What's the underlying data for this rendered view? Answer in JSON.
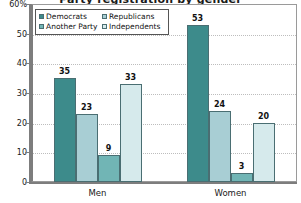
{
  "chart_data": {
    "type": "bar",
    "title": "Party registration by gender",
    "xlabel": "",
    "ylabel": "",
    "ylim": [
      0,
      60
    ],
    "ytick_labels": [
      "60%",
      "50",
      "40",
      "30",
      "20",
      "10",
      "0"
    ],
    "ytick_values": [
      60,
      50,
      40,
      30,
      20,
      10,
      0
    ],
    "grid": true,
    "legend_position": "top-left",
    "categories": [
      "Men",
      "Women"
    ],
    "series": [
      {
        "name": "Democrats",
        "values": [
          35,
          23
        ],
        "color": "#3d8b8b"
      },
      {
        "name": "Republicans",
        "values": [
          23,
          24
        ],
        "color": "#a8ced4"
      },
      {
        "name": "Another Party",
        "values": [
          9,
          3
        ],
        "color": "#71b5b5"
      },
      {
        "name": "Independents",
        "values": [
          33,
          20
        ],
        "color": "#d6eaec"
      }
    ],
    "data_labels": {
      "Men": [
        35,
        23,
        9,
        33
      ],
      "Women": [
        53,
        24,
        3,
        20
      ]
    },
    "bars": [
      {
        "group": "Men",
        "series": "Democrats",
        "value": 35,
        "color": "#3d8b8b"
      },
      {
        "group": "Men",
        "series": "Republicans",
        "value": 23,
        "color": "#a8ced4"
      },
      {
        "group": "Men",
        "series": "Another Party",
        "value": 9,
        "color": "#71b5b5"
      },
      {
        "group": "Men",
        "series": "Independents",
        "value": 33,
        "color": "#d6eaec"
      },
      {
        "group": "Women",
        "series": "Democrats",
        "value": 53,
        "color": "#3d8b8b"
      },
      {
        "group": "Women",
        "series": "Republicans",
        "value": 24,
        "color": "#a8ced4"
      },
      {
        "group": "Women",
        "series": "Another Party",
        "value": 3,
        "color": "#71b5b5"
      },
      {
        "group": "Women",
        "series": "Independents",
        "value": 20,
        "color": "#d6eaec"
      }
    ]
  },
  "legend": {
    "entries": [
      {
        "label": "Democrats",
        "color": "#3d8b8b"
      },
      {
        "label": "Republicans",
        "color": "#a8ced4"
      },
      {
        "label": "Another Party",
        "color": "#71b5b5"
      },
      {
        "label": "Independents",
        "color": "#d6eaec"
      }
    ]
  },
  "colors": {
    "democrats": "#3d8b8b",
    "republicans": "#a8ced4",
    "another_party": "#71b5b5",
    "independents": "#d6eaec",
    "bar_border": "#4a6e72",
    "axis": "#7d7d7d",
    "gridline": "#bdbdbd",
    "text": "#111111"
  }
}
